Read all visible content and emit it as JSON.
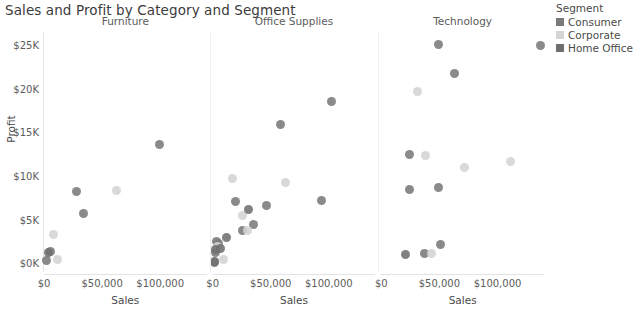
{
  "chart_data": {
    "type": "scatter",
    "title": "Sales and Profit by Category and Segment",
    "xlabel": "Sales",
    "ylabel": "Profit",
    "xlim": [
      0,
      140000
    ],
    "ylim": [
      -1000,
      26500
    ],
    "grid": false,
    "legend": {
      "title": "Segment",
      "position": "right",
      "entries": [
        {
          "name": "Consumer",
          "color": "#7a7a7a"
        },
        {
          "name": "Corporate",
          "color": "#d4d4d4"
        },
        {
          "name": "Home Office",
          "color": "#6f6f6f"
        }
      ]
    },
    "facet_variable": "Category",
    "facets": [
      "Furniture",
      "Office Supplies",
      "Technology"
    ],
    "x_ticks": [
      {
        "value": 0,
        "label": "$0"
      },
      {
        "value": 50000,
        "label": "$50,000"
      },
      {
        "value": 100000,
        "label": "$100,000"
      }
    ],
    "y_ticks": [
      {
        "value": 0,
        "label": "$0K"
      },
      {
        "value": 5000,
        "label": "$5K"
      },
      {
        "value": 10000,
        "label": "$10K"
      },
      {
        "value": 15000,
        "label": "$15K"
      },
      {
        "value": 20000,
        "label": "$20K"
      },
      {
        "value": 25000,
        "label": "$25K"
      }
    ],
    "series": [
      {
        "name": "Consumer",
        "color": "#7a7a7a",
        "points": [
          {
            "facet": "Furniture",
            "x": 2000,
            "y": 300
          },
          {
            "facet": "Furniture",
            "x": 6000,
            "y": 1400
          },
          {
            "facet": "Furniture",
            "x": 34000,
            "y": 5700
          },
          {
            "facet": "Furniture",
            "x": 28000,
            "y": 8200
          },
          {
            "facet": "Furniture",
            "x": 99000,
            "y": 13600
          },
          {
            "facet": "Office Supplies",
            "x": 1500,
            "y": 100
          },
          {
            "facet": "Office Supplies",
            "x": 2500,
            "y": 1200
          },
          {
            "facet": "Office Supplies",
            "x": 5000,
            "y": 2300
          },
          {
            "facet": "Office Supplies",
            "x": 3500,
            "y": 2500
          },
          {
            "facet": "Office Supplies",
            "x": 26000,
            "y": 3800
          },
          {
            "facet": "Office Supplies",
            "x": 35000,
            "y": 4500
          },
          {
            "facet": "Office Supplies",
            "x": 20000,
            "y": 7100
          },
          {
            "facet": "Office Supplies",
            "x": 46000,
            "y": 6600
          },
          {
            "facet": "Office Supplies",
            "x": 58000,
            "y": 15900
          },
          {
            "facet": "Office Supplies",
            "x": 102000,
            "y": 18500
          },
          {
            "facet": "Office Supplies",
            "x": 94000,
            "y": 7200
          },
          {
            "facet": "Technology",
            "x": 51000,
            "y": 2200
          },
          {
            "facet": "Technology",
            "x": 37000,
            "y": 1100
          },
          {
            "facet": "Technology",
            "x": 24000,
            "y": 8500
          },
          {
            "facet": "Technology",
            "x": 49000,
            "y": 8700
          },
          {
            "facet": "Technology",
            "x": 24000,
            "y": 12500
          },
          {
            "facet": "Technology",
            "x": 63000,
            "y": 21800
          },
          {
            "facet": "Technology",
            "x": 49000,
            "y": 25100
          },
          {
            "facet": "Technology",
            "x": 137000,
            "y": 24900
          }
        ]
      },
      {
        "name": "Corporate",
        "color": "#d4d4d4",
        "points": [
          {
            "facet": "Furniture",
            "x": 12000,
            "y": 400
          },
          {
            "facet": "Furniture",
            "x": 8000,
            "y": 3300
          },
          {
            "facet": "Furniture",
            "x": 62000,
            "y": 8300
          },
          {
            "facet": "Office Supplies",
            "x": 9000,
            "y": 400
          },
          {
            "facet": "Office Supplies",
            "x": 4000,
            "y": 1900
          },
          {
            "facet": "Office Supplies",
            "x": 30000,
            "y": 3700
          },
          {
            "facet": "Office Supplies",
            "x": 26000,
            "y": 5500
          },
          {
            "facet": "Office Supplies",
            "x": 17000,
            "y": 9700
          },
          {
            "facet": "Office Supplies",
            "x": 63000,
            "y": 9300
          },
          {
            "facet": "Technology",
            "x": 43000,
            "y": 1100
          },
          {
            "facet": "Technology",
            "x": 38000,
            "y": 12300
          },
          {
            "facet": "Technology",
            "x": 72000,
            "y": 11000
          },
          {
            "facet": "Technology",
            "x": 31000,
            "y": 19700
          },
          {
            "facet": "Technology",
            "x": 111000,
            "y": 11700
          }
        ]
      },
      {
        "name": "Home Office",
        "color": "#6f6f6f",
        "points": [
          {
            "facet": "Furniture",
            "x": 3500,
            "y": 1200
          },
          {
            "facet": "Office Supplies",
            "x": 1200,
            "y": 200
          },
          {
            "facet": "Office Supplies",
            "x": 2200,
            "y": 1600
          },
          {
            "facet": "Office Supplies",
            "x": 6500,
            "y": 1700
          },
          {
            "facet": "Office Supplies",
            "x": 12000,
            "y": 2900
          },
          {
            "facet": "Office Supplies",
            "x": 31000,
            "y": 6200
          },
          {
            "facet": "Technology",
            "x": 21000,
            "y": 1000
          }
        ]
      }
    ]
  }
}
